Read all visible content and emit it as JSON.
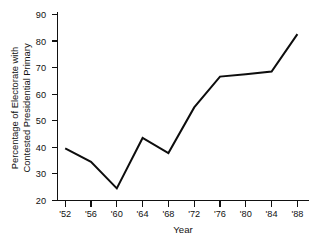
{
  "chart_data": {
    "type": "line",
    "title": "",
    "xlabel": "Year",
    "ylabel": "Percentage of Electorate with Contested Presidential Primary",
    "ylabel_lines": [
      "Percentage of Electorate with",
      "Contested Presidential Primary"
    ],
    "categories": [
      "'52",
      "'56",
      "'60",
      "'64",
      "'68",
      "'72",
      "'76",
      "'80",
      "'84",
      "'88"
    ],
    "x": [
      1952,
      1956,
      1960,
      1964,
      1968,
      1972,
      1976,
      1980,
      1984,
      1988
    ],
    "values": [
      39.6,
      34.5,
      24.5,
      43.5,
      37.8,
      55.0,
      66.6,
      67.5,
      68.5,
      82.6
    ],
    "series": [
      {
        "name": "Percentage of Electorate with Contested Presidential Primary",
        "values": [
          39.6,
          34.5,
          24.5,
          43.5,
          37.8,
          55.0,
          66.6,
          67.5,
          68.5,
          82.6
        ],
        "color": "#0d0d0d"
      }
    ],
    "ylim": [
      20,
      90
    ],
    "xlim": [
      "'52",
      "'88"
    ],
    "yticks": [
      20,
      30,
      40,
      50,
      60,
      70,
      80,
      90
    ],
    "ytick_labels": [
      "20",
      "30",
      "40",
      "50",
      "60",
      "70",
      "80",
      "90"
    ],
    "xticks": [
      "'52",
      "'56",
      "'60",
      "'64",
      "'68",
      "'72",
      "'76",
      "'80",
      "'84",
      "'88"
    ],
    "grid": false,
    "legend": false,
    "legend_position": "none",
    "background_color": "#ffffff",
    "axis_color": "#111111"
  }
}
